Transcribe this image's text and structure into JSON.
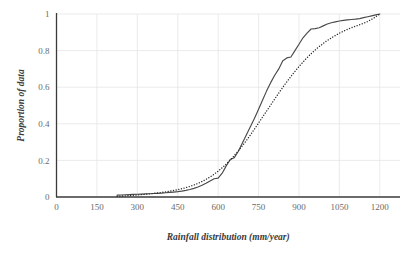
{
  "chart_data": {
    "type": "line",
    "title": "",
    "xlabel": "Rainfall distribution (mm/year)",
    "ylabel": "Proportion of data",
    "xlim": [
      0,
      1275
    ],
    "ylim": [
      0,
      1
    ],
    "xticks": [
      0,
      150,
      300,
      450,
      600,
      750,
      900,
      1050,
      1200
    ],
    "yticks": [
      0,
      0.2,
      0.4,
      0.6,
      0.8,
      1
    ],
    "xtick_labels": [
      "0",
      "150",
      "300",
      "450",
      "600",
      "750",
      "900",
      "1050",
      "1200"
    ],
    "ytick_labels": [
      "0",
      "0.2",
      "0.4",
      "0.6",
      "0.8",
      "1"
    ],
    "grid": true,
    "grid_color": "#e2e2e2",
    "legend": "none",
    "series": [
      {
        "name": "Empirical cumulative distribution",
        "style": "solid",
        "color": "#4a4a4a",
        "x": [
          225,
          240,
          255,
          270,
          285,
          300,
          315,
          330,
          345,
          360,
          375,
          390,
          405,
          420,
          435,
          450,
          465,
          480,
          495,
          510,
          525,
          540,
          555,
          570,
          585,
          600,
          615,
          630,
          645,
          660,
          675,
          690,
          705,
          720,
          735,
          750,
          765,
          780,
          795,
          810,
          825,
          840,
          855,
          870,
          885,
          900,
          915,
          930,
          945,
          960,
          975,
          990,
          1005,
          1020,
          1035,
          1050,
          1065,
          1080,
          1095,
          1110,
          1125,
          1140,
          1155,
          1170,
          1185,
          1200
        ],
        "y": [
          0.01,
          0.011,
          0.012,
          0.013,
          0.014,
          0.015,
          0.016,
          0.017,
          0.018,
          0.019,
          0.02,
          0.021,
          0.023,
          0.025,
          0.027,
          0.029,
          0.032,
          0.036,
          0.041,
          0.047,
          0.055,
          0.064,
          0.075,
          0.088,
          0.1,
          0.103,
          0.13,
          0.17,
          0.205,
          0.215,
          0.25,
          0.295,
          0.34,
          0.385,
          0.43,
          0.48,
          0.53,
          0.58,
          0.625,
          0.665,
          0.7,
          0.745,
          0.76,
          0.765,
          0.8,
          0.835,
          0.87,
          0.895,
          0.918,
          0.92,
          0.925,
          0.935,
          0.945,
          0.952,
          0.957,
          0.962,
          0.965,
          0.968,
          0.97,
          0.972,
          0.975,
          0.98,
          0.985,
          0.99,
          0.995,
          1.0
        ]
      },
      {
        "name": "Fitted distribution",
        "style": "dotted",
        "color": "#2a2a2a",
        "x": [
          225,
          250,
          275,
          300,
          325,
          350,
          375,
          400,
          425,
          450,
          475,
          500,
          525,
          550,
          575,
          600,
          625,
          650,
          675,
          700,
          725,
          750,
          775,
          800,
          825,
          850,
          875,
          900,
          925,
          950,
          975,
          1000,
          1025,
          1050,
          1075,
          1100,
          1125,
          1150,
          1175,
          1200
        ],
        "y": [
          0.004,
          0.006,
          0.008,
          0.011,
          0.014,
          0.018,
          0.022,
          0.027,
          0.033,
          0.04,
          0.049,
          0.06,
          0.074,
          0.092,
          0.114,
          0.141,
          0.173,
          0.21,
          0.252,
          0.299,
          0.35,
          0.404,
          0.459,
          0.514,
          0.568,
          0.62,
          0.668,
          0.713,
          0.754,
          0.79,
          0.822,
          0.85,
          0.874,
          0.895,
          0.913,
          0.928,
          0.941,
          0.955,
          0.975,
          1.0
        ]
      }
    ]
  }
}
